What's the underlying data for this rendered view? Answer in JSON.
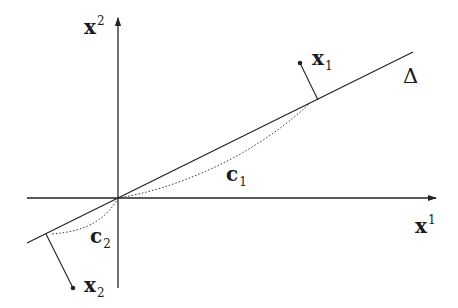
{
  "diagram": {
    "axes": {
      "x_axis_label": {
        "base": "x",
        "superscript": "1"
      },
      "y_axis_label": {
        "base": "x",
        "superscript": "2"
      }
    },
    "line": {
      "label": "Δ"
    },
    "points": [
      {
        "id": "x1",
        "base": "x",
        "subscript": "1"
      },
      {
        "id": "x2",
        "base": "x",
        "subscript": "2"
      }
    ],
    "curves": [
      {
        "id": "c1",
        "base": "c",
        "subscript": "1",
        "style": "dotted"
      },
      {
        "id": "c2",
        "base": "c",
        "subscript": "2",
        "style": "dotted"
      }
    ],
    "colors": {
      "stroke": "#222222",
      "background": "#ffffff"
    }
  }
}
